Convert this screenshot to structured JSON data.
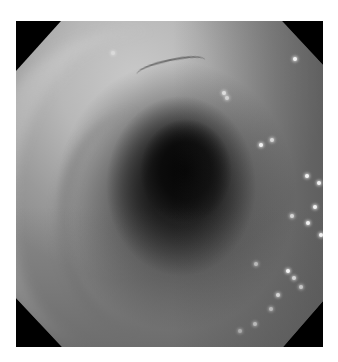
{
  "image": {
    "subject": "endoscopic view of a tubular lumen (grayscale)",
    "frame_shape": "octagon",
    "background_color": "#ffffff",
    "mask_color": "#000000",
    "lumen_color": "#050505",
    "mucosa_light_color": "#c9c9c9",
    "mucosa_dark_color": "#5a5a5a"
  }
}
